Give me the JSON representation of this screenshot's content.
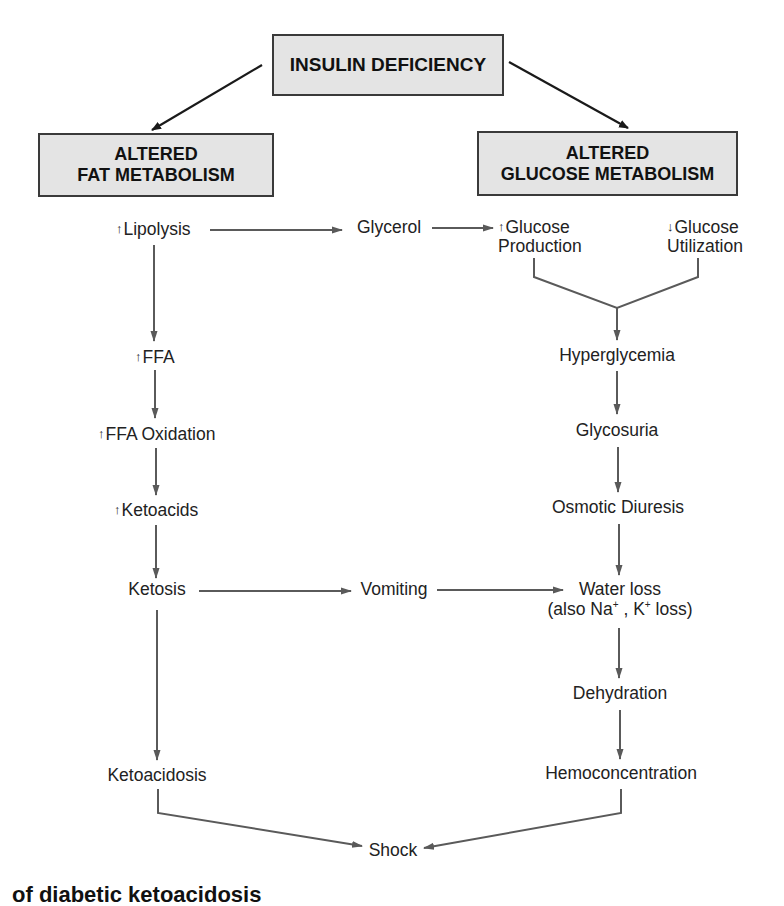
{
  "diagram": {
    "root": {
      "label": "INSULIN DEFICIENCY"
    },
    "branches": {
      "fat": {
        "line1": "ALTERED",
        "line2": "FAT METABOLISM"
      },
      "glucose": {
        "line1": "ALTERED",
        "line2": "GLUCOSE METABOLISM"
      }
    },
    "fat_path": {
      "lipolysis": {
        "arrow": "↑",
        "text": "Lipolysis"
      },
      "ffa": {
        "arrow": "↑",
        "text": "FFA"
      },
      "ffa_oxidation": {
        "arrow": "↑",
        "text": "FFA Oxidation"
      },
      "ketoacids": {
        "arrow": "↑",
        "text": "Ketoacids"
      },
      "ketosis": "Ketosis",
      "ketoacidosis": "Ketoacidosis"
    },
    "middle": {
      "glycerol": "Glycerol",
      "vomiting": "Vomiting"
    },
    "glucose_path": {
      "glucose_production": {
        "arrow": "↑",
        "line1": "Glucose",
        "line2": "Production"
      },
      "glucose_utilization": {
        "arrow": "↓",
        "line1": "Glucose",
        "line2": "Utilization"
      },
      "hyperglycemia": "Hyperglycemia",
      "glycosuria": "Glycosuria",
      "osmotic_diuresis": "Osmotic Diuresis",
      "water_loss": {
        "line1": "Water loss",
        "line2_prefix": "(also Na",
        "na_sup": "+",
        "line2_mid": " , K",
        "k_sup": "+",
        "line2_suffix": " loss)"
      },
      "dehydration": "Dehydration",
      "hemoconcentration": "Hemoconcentration"
    },
    "outcome": "Shock",
    "caption_partial": "of diabetic ketoacidosis",
    "colors": {
      "box_fill": "#e4e4e4",
      "box_border": "#3a3a3a",
      "primary_arrow": "#1a1a1a",
      "flow_arrow": "#5a5a5a"
    }
  }
}
